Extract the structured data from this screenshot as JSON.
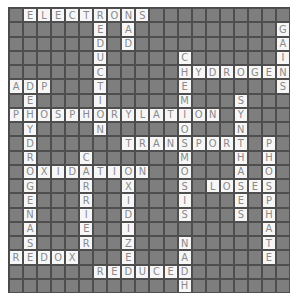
{
  "puzzle": {
    "type": "crossword",
    "rows": 20,
    "cols": 20,
    "colors": {
      "block": "#7e7e7e",
      "open": "#f6f6f6",
      "letter": "#8a8a8a",
      "gridline": "#4e4e4e"
    },
    "grid": [
      ".ELECTRONS..........",
      "......E.A..........G",
      "......D.D..........A",
      "......U.....C......I",
      "......C.....HYDROGEN",
      "ADP...T.....E......S",
      ".E....I.....M...S...",
      "PHOSPHORYLATION.Y...",
      ".Y....N.....O...N...",
      ".D......TRANSPORT.P.",
      ".R...C......M...H.H.",
      ".OXIDATION..O...A.O.",
      ".G...R..X...S.LOSES.",
      ".E...R..I...I...E.P.",
      ".N...I..D...S...S.H.",
      ".A...E..I.........A.",
      ".S...R..Z...N.....T.",
      "REDOX...E...A.....E.",
      "......REDUCED.......",
      "............H......."
    ],
    "words": [
      "ELECTRONS",
      "REDUCTION",
      "NAD",
      "GAINS",
      "CHEMIOSMOSIS",
      "HYDROGEN",
      "ADP",
      "DEHYDROGENASE",
      "PHOSPHORYLATION",
      "SYNTHASES",
      "TRANSPORT",
      "PHOSPHATE",
      "CARRIER",
      "OXIDATION",
      "OXIDIZE",
      "LOSES",
      "NADH",
      "REDOX",
      "REDUCED"
    ]
  }
}
